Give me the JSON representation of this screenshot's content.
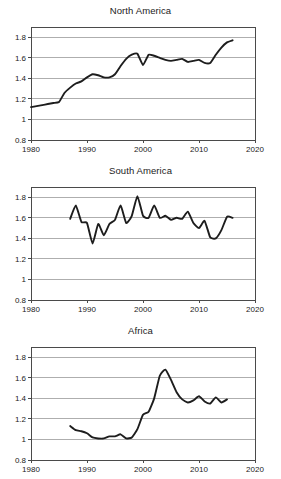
{
  "figure": {
    "panel_count": 3,
    "line_color": "#1d1d1d",
    "grid_color": "#9a9a9a",
    "axis_color": "#4a4a4a",
    "background": "#ffffff"
  },
  "chart_data": [
    {
      "type": "line",
      "title": "North America",
      "xlabel": "",
      "ylabel": "",
      "xlim": [
        1980,
        2020
      ],
      "ylim": [
        0.8,
        1.9
      ],
      "xticks": [
        1980,
        1990,
        2000,
        2010,
        2020
      ],
      "xtick_labels": [
        "1980",
        "1990",
        "2000",
        "2010",
        "2020"
      ],
      "yticks": [
        0.8,
        1.0,
        1.2,
        1.4,
        1.6,
        1.8
      ],
      "ytick_labels": [
        "0.8",
        "1",
        "1.2",
        "1.4",
        "1.6",
        "1.8"
      ],
      "grid": "horizontal",
      "legend": "none",
      "x": [
        1980,
        1981,
        1982,
        1983,
        1984,
        1985,
        1986,
        1987,
        1988,
        1989,
        1990,
        1991,
        1992,
        1993,
        1994,
        1995,
        1996,
        1997,
        1998,
        1999,
        2000,
        2001,
        2002,
        2003,
        2004,
        2005,
        2006,
        2007,
        2008,
        2009,
        2010,
        2011,
        2012,
        2013,
        2014,
        2015,
        2016
      ],
      "values": [
        1.12,
        1.13,
        1.14,
        1.15,
        1.16,
        1.17,
        1.26,
        1.31,
        1.35,
        1.37,
        1.41,
        1.44,
        1.43,
        1.41,
        1.41,
        1.44,
        1.52,
        1.59,
        1.63,
        1.64,
        1.53,
        1.63,
        1.62,
        1.6,
        1.58,
        1.57,
        1.58,
        1.59,
        1.56,
        1.57,
        1.58,
        1.55,
        1.55,
        1.63,
        1.7,
        1.75,
        1.77
      ]
    },
    {
      "type": "line",
      "title": "South America",
      "xlabel": "",
      "ylabel": "",
      "xlim": [
        1980,
        2020
      ],
      "ylim": [
        0.8,
        1.9
      ],
      "xticks": [
        1980,
        1990,
        2000,
        2010,
        2020
      ],
      "xtick_labels": [
        "1980",
        "1990",
        "2000",
        "2010",
        "2020"
      ],
      "yticks": [
        0.8,
        1.0,
        1.2,
        1.4,
        1.6,
        1.8
      ],
      "ytick_labels": [
        "0.8",
        "1",
        "1.2",
        "1.4",
        "1.6",
        "1.8"
      ],
      "grid": "horizontal",
      "legend": "none",
      "x": [
        1987,
        1988,
        1989,
        1990,
        1991,
        1992,
        1993,
        1994,
        1995,
        1996,
        1997,
        1998,
        1999,
        2000,
        2001,
        2002,
        2003,
        2004,
        2005,
        2006,
        2007,
        2008,
        2009,
        2010,
        2011,
        2012,
        2013,
        2014,
        2015,
        2016
      ],
      "values": [
        1.59,
        1.72,
        1.56,
        1.55,
        1.35,
        1.54,
        1.43,
        1.54,
        1.58,
        1.72,
        1.55,
        1.62,
        1.81,
        1.62,
        1.6,
        1.72,
        1.6,
        1.62,
        1.58,
        1.6,
        1.59,
        1.66,
        1.55,
        1.5,
        1.57,
        1.41,
        1.4,
        1.48,
        1.61,
        1.6
      ]
    },
    {
      "type": "line",
      "title": "Africa",
      "xlabel": "",
      "ylabel": "",
      "xlim": [
        1980,
        2020
      ],
      "ylim": [
        0.8,
        1.9
      ],
      "xticks": [
        1980,
        1990,
        2000,
        2010,
        2020
      ],
      "xtick_labels": [
        "1980",
        "1990",
        "2000",
        "2010",
        "2020"
      ],
      "yticks": [
        0.8,
        1.0,
        1.2,
        1.4,
        1.6,
        1.8
      ],
      "ytick_labels": [
        "0.8",
        "1",
        "1.2",
        "1.4",
        "1.6",
        "1.8"
      ],
      "grid": "horizontal",
      "legend": "none",
      "x": [
        1987,
        1988,
        1989,
        1990,
        1991,
        1992,
        1993,
        1994,
        1995,
        1996,
        1997,
        1998,
        1999,
        2000,
        2001,
        2002,
        2003,
        2004,
        2005,
        2006,
        2007,
        2008,
        2009,
        2010,
        2011,
        2012,
        2013,
        2014,
        2015
      ],
      "values": [
        1.13,
        1.09,
        1.08,
        1.06,
        1.02,
        1.01,
        1.01,
        1.03,
        1.03,
        1.05,
        1.01,
        1.02,
        1.1,
        1.24,
        1.27,
        1.4,
        1.62,
        1.68,
        1.58,
        1.46,
        1.39,
        1.36,
        1.38,
        1.42,
        1.37,
        1.35,
        1.41,
        1.36,
        1.39
      ]
    }
  ]
}
